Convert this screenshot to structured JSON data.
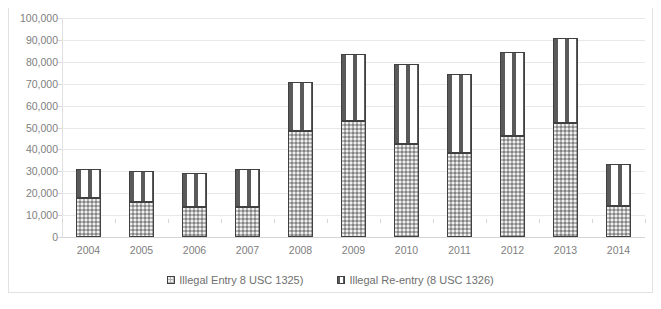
{
  "chart_data": {
    "type": "bar",
    "stacked": true,
    "title": "",
    "xlabel": "",
    "ylabel": "",
    "ylim": [
      0,
      100000
    ],
    "ytick_step": 10000,
    "grid": true,
    "legend_position": "bottom",
    "categories": [
      "2004",
      "2005",
      "2006",
      "2007",
      "2008",
      "2009",
      "2010",
      "2011",
      "2012",
      "2013",
      "2014"
    ],
    "ytick_labels": [
      "100,000",
      "90,000",
      "80,000",
      "70,000",
      "60,000",
      "50,000",
      "40,000",
      "30,000",
      "20,000",
      "10,000",
      "0"
    ],
    "ytick_values": [
      100000,
      90000,
      80000,
      70000,
      60000,
      50000,
      40000,
      30000,
      20000,
      10000,
      0
    ],
    "series": [
      {
        "name": "Illegal Entry 8 USC 1325)",
        "key": "entry",
        "values": [
          18000,
          16000,
          13500,
          13500,
          48500,
          53000,
          42500,
          38500,
          46000,
          52000,
          14000
        ]
      },
      {
        "name": "Illegal Re-entry (8 USC 1326)",
        "key": "reentry",
        "values": [
          13000,
          14000,
          15500,
          17500,
          22500,
          30500,
          36500,
          36000,
          38500,
          39000,
          19500
        ]
      }
    ],
    "totals": [
      31000,
      30000,
      29000,
      31000,
      71000,
      83500,
      79000,
      74500,
      84500,
      91000,
      33500
    ]
  },
  "legend": {
    "items": [
      {
        "label": "Illegal Entry 8 USC 1325)",
        "swatch": "entry"
      },
      {
        "label": "Illegal Re-entry (8 USC 1326)",
        "swatch": "reentry"
      }
    ]
  },
  "colors": {
    "series_entry_fill": "#b3b3b3",
    "series_reentry_fill": "#ffffff",
    "bar_outline": "#404040",
    "gridline": "#e8e8e8",
    "tick_text": "#808080",
    "legend_text": "#6f6f6f",
    "frame": "#e2e2e2",
    "background": "#ffffff"
  }
}
